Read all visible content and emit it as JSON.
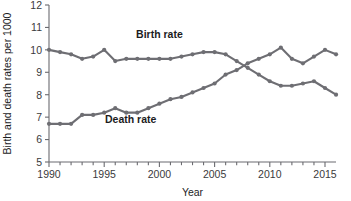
{
  "chart_data": {
    "type": "line",
    "title": "",
    "xlabel": "Year",
    "ylabel": "Birth and death rates per 1000",
    "xlim": [
      1990,
      2016
    ],
    "ylim": [
      5,
      12
    ],
    "xticks": [
      1990,
      1995,
      2000,
      2005,
      2010,
      2015
    ],
    "xtick_labels": [
      "1990",
      "1995",
      "2000",
      "2005",
      "2010",
      "2015"
    ],
    "minor_xtick_step": 1,
    "yticks": [
      5,
      6,
      7,
      8,
      9,
      10,
      11,
      12
    ],
    "ytick_labels": [
      "5",
      "6",
      "7",
      "8",
      "9",
      "10",
      "11",
      "12"
    ],
    "grid": false,
    "legend": "inline-annotation",
    "line_color": "#6e6e73",
    "marker": "circle",
    "x": [
      1990,
      1991,
      1992,
      1993,
      1994,
      1995,
      1996,
      1997,
      1998,
      1999,
      2000,
      2001,
      2002,
      2003,
      2004,
      2005,
      2006,
      2007,
      2008,
      2009,
      2010,
      2011,
      2012,
      2013,
      2014,
      2015,
      2016
    ],
    "series": [
      {
        "name": "Birth rate",
        "label": "Birth rate",
        "label_x": 2000,
        "label_y": 10.55,
        "values": [
          10.0,
          9.9,
          9.8,
          9.6,
          9.7,
          10.0,
          9.5,
          9.6,
          9.6,
          9.6,
          9.6,
          9.6,
          9.7,
          9.8,
          9.9,
          9.9,
          9.8,
          9.5,
          9.2,
          8.9,
          8.6,
          8.4,
          8.4,
          8.5,
          8.6,
          8.3,
          8.0
        ],
        "values_note": "birth rate per 1000"
      },
      {
        "name": "Death rate",
        "label": "Death rate",
        "label_x": 1997.4,
        "label_y": 6.75,
        "values": [
          6.7,
          6.7,
          6.7,
          7.1,
          7.1,
          7.2,
          7.4,
          7.2,
          7.2,
          7.4,
          7.6,
          7.8,
          7.9,
          8.1,
          8.3,
          8.5,
          8.9,
          9.1,
          9.4,
          9.6,
          9.8,
          10.1,
          9.6,
          9.4,
          9.7,
          10.0,
          9.8
        ],
        "values_note": "death rate per 1000"
      }
    ],
    "crossover": {
      "year": 2006.5,
      "value": 9.1
    }
  }
}
